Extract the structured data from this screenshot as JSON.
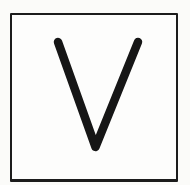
{
  "icon": {
    "letter": "V"
  },
  "colors": {
    "page_background": "#fbfbf9",
    "frame_border": "#1c1c1c",
    "frame_fill": "#fdfdfc",
    "glyph_stroke": "#161616"
  }
}
